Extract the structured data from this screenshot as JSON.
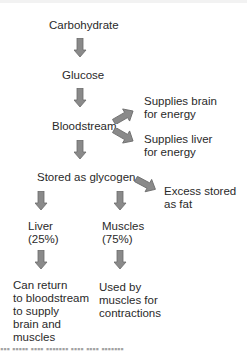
{
  "diagram": {
    "nodes": {
      "carbohydrate": "Carbohydrate",
      "glucose": "Glucose",
      "bloodstream": "Bloodstream",
      "brain_1": "Supplies brain",
      "brain_2": "for energy",
      "liver_e_1": "Supplies liver",
      "liver_e_2": "for energy",
      "glycogen": "Stored as glycogen",
      "fat_1": "Excess stored",
      "fat_2": "as fat",
      "liver_1": "Liver",
      "liver_2": "(25%)",
      "muscles_1": "Muscles",
      "muscles_2": "(75%)",
      "liver_out_1": "Can return",
      "liver_out_2": "to bloodstream",
      "liver_out_3": "to supply",
      "liver_out_4": "brain and",
      "liver_out_5": "muscles",
      "muscle_out_1": "Used by",
      "muscle_out_2": "muscles for",
      "muscle_out_3": "contractions"
    },
    "edges": [
      [
        "Carbohydrate",
        "Glucose"
      ],
      [
        "Glucose",
        "Bloodstream"
      ],
      [
        "Bloodstream",
        "Supplies brain for energy"
      ],
      [
        "Bloodstream",
        "Supplies liver for energy"
      ],
      [
        "Bloodstream",
        "Stored as glycogen"
      ],
      [
        "Stored as glycogen",
        "Excess stored as fat"
      ],
      [
        "Stored as glycogen",
        "Liver (25%)"
      ],
      [
        "Stored as glycogen",
        "Muscles (75%)"
      ],
      [
        "Liver (25%)",
        "Can return to bloodstream to supply brain and muscles"
      ],
      [
        "Muscles (75%)",
        "Used by muscles for contractions"
      ]
    ],
    "colors": {
      "arrow_fill": "#8a8a8a",
      "arrow_stroke": "#6a6a6a",
      "text": "#2a2a2a"
    }
  }
}
